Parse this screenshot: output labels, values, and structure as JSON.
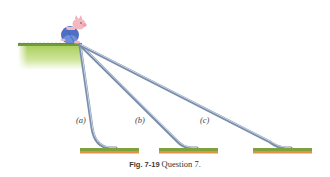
{
  "figure": {
    "caption_label": "Fig. 7-19",
    "caption_text": "Question 7.",
    "slides": [
      {
        "label": "(a)"
      },
      {
        "label": "(b)"
      },
      {
        "label": "(c)"
      }
    ],
    "colors": {
      "grass_top": "#6a9a3a",
      "grass_body": "#a8cf5a",
      "slide": "#7a8eaa",
      "slide_highlight": "#c9d6ea",
      "ground_grass": "#7fa33c",
      "ground_soil": "#e0914a",
      "pig_body": "#f4b9c0",
      "pig_overalls": "#4f6fc4"
    }
  }
}
